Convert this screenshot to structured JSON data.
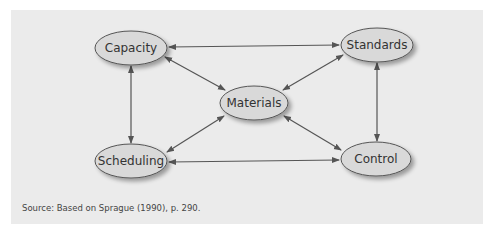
{
  "diagram": {
    "nodes": [
      {
        "id": "capacity",
        "label": "Capacity",
        "cx": 131,
        "cy": 48
      },
      {
        "id": "standards",
        "label": "Standards",
        "cx": 377,
        "cy": 45
      },
      {
        "id": "materials",
        "label": "Materials",
        "cx": 254,
        "cy": 103
      },
      {
        "id": "scheduling",
        "label": "Scheduling",
        "cx": 131,
        "cy": 161
      },
      {
        "id": "control",
        "label": "Control",
        "cx": 376,
        "cy": 159
      }
    ],
    "edges": [
      {
        "from": "capacity",
        "to": "standards",
        "bidirectional": true
      },
      {
        "from": "capacity",
        "to": "scheduling",
        "bidirectional": true
      },
      {
        "from": "standards",
        "to": "control",
        "bidirectional": true
      },
      {
        "from": "scheduling",
        "to": "control",
        "bidirectional": true
      },
      {
        "from": "capacity",
        "to": "materials",
        "bidirectional": true
      },
      {
        "from": "standards",
        "to": "materials",
        "bidirectional": true
      },
      {
        "from": "scheduling",
        "to": "materials",
        "bidirectional": true
      },
      {
        "from": "control",
        "to": "materials",
        "bidirectional": true
      }
    ]
  },
  "source": "Source: Based on Sprague (1990), p. 290.",
  "colors": {
    "panel": "#ebebeb",
    "node_fill": "#d9d9d9",
    "stroke": "#555555"
  }
}
